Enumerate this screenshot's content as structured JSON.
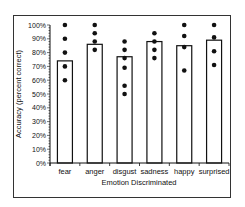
{
  "chart_data": {
    "type": "bar",
    "title": "",
    "xlabel": "Emotion Discriminated",
    "ylabel": "Accuracy (percent correct)",
    "ylim": [
      0,
      100
    ],
    "yticks": [
      "0%",
      "10%",
      "20%",
      "30%",
      "40%",
      "50%",
      "60%",
      "70%",
      "80%",
      "90%",
      "100%"
    ],
    "categories": [
      "fear",
      "anger",
      "disgust",
      "sadness",
      "happy",
      "surprised"
    ],
    "values": [
      74,
      86,
      77,
      88,
      85,
      89
    ],
    "points": [
      [
        100,
        90,
        80,
        70,
        60
      ],
      [
        100,
        94,
        88,
        82
      ],
      [
        88,
        82,
        76,
        69,
        56,
        50
      ],
      [
        94,
        88,
        82,
        76
      ],
      [
        100,
        92,
        84,
        67
      ],
      [
        100,
        91,
        81,
        71
      ]
    ],
    "grid": false,
    "legend": null,
    "colors": {
      "bar_fill": "#ffffff",
      "bar_stroke": "#111111",
      "point": "#111111"
    }
  }
}
